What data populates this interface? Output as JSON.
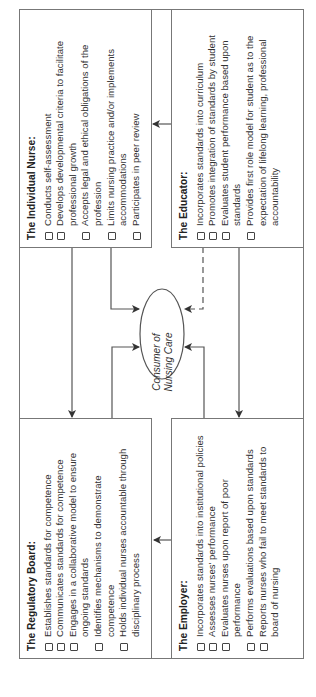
{
  "diagram": {
    "center": {
      "label_line1": "Consumer of",
      "label_line2": "Nursing Care"
    },
    "boxes": {
      "regulatory_board": {
        "title": "The Regulatory Board:",
        "items": [
          "Establishes standards for competence",
          "Communicates standards for competence",
          "Engages in a collaborative model to ensure ongoing standards",
          "Identifies mechanisms to demonstrate competence",
          "Holds individual nurses accountable through disciplinary process"
        ]
      },
      "individual_nurse": {
        "title": "The Individual Nurse:",
        "items": [
          "Conducts  self-assessment",
          "Develops developmental criteria to facilitate professional growth",
          "Accepts legal and ethical obligations of the profession",
          "Limits nursing practice and/or implements accommodations",
          "Participates in peer review"
        ]
      },
      "employer": {
        "title": "The Employer:",
        "items": [
          "Incorporates standards into institutional policies",
          "Assesses nurses' performance",
          "Evaluates nurses upon report of poor performance",
          "Performs evaluations based upon standards",
          "Reports nurses who fail to meet standards to board of nursing"
        ]
      },
      "educator": {
        "title": "The Educator:",
        "items": [
          "Incorporates standards into curriculum",
          "Promotes integration of standards by student",
          "Evaluates student performance based upon standards",
          "Provides first role model for student as to the expectation of lifelong learning, professional  accountability"
        ]
      }
    },
    "colors": {
      "line": "#555555",
      "border": "#777777",
      "text": "#333333"
    }
  }
}
